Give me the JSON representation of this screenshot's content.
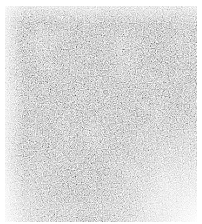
{
  "image": {
    "description": "Grayscale noise texture with white margins",
    "colors": {
      "background": "#ffffff",
      "noise_dark": "#555555",
      "noise_mid": "#9a9a9a",
      "noise_light": "#e8e8e8"
    },
    "region": {
      "x": 5,
      "y": 6,
      "width": 192,
      "height": 216
    }
  }
}
